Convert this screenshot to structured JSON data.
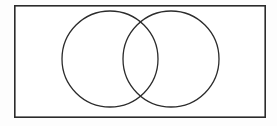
{
  "figure": {
    "kind": "venn-diagram",
    "background_color": "#fdfdfd",
    "canvas": {
      "width": 277,
      "height": 126
    }
  },
  "universe": {
    "name": "universal-set-rectangle",
    "label": "",
    "x": 14,
    "y": 5,
    "width": 252,
    "height": 113,
    "stroke_color": "#2b2b2b",
    "stroke_width": 1.6,
    "fill_color": "#ffffff"
  },
  "sets": [
    {
      "name": "set-a",
      "label": "",
      "cx": 110,
      "cy": 59,
      "r": 48,
      "stroke_color": "#2b2b2b",
      "stroke_width": 1.3,
      "fill_color": "none"
    },
    {
      "name": "set-b",
      "label": "",
      "cx": 171,
      "cy": 59,
      "r": 48,
      "stroke_color": "#2b2b2b",
      "stroke_width": 1.3,
      "fill_color": "none"
    }
  ],
  "regions": [
    {
      "name": "region-a-only",
      "label": "",
      "cx": 92,
      "cy": 59
    },
    {
      "name": "region-intersection",
      "label": "",
      "cx": 140,
      "cy": 59
    },
    {
      "name": "region-b-only",
      "label": "",
      "cx": 189,
      "cy": 59
    },
    {
      "name": "region-outside",
      "label": "",
      "cx": 35,
      "cy": 20
    }
  ],
  "intersection_points": [
    {
      "name": "upper-crossing",
      "x": 141,
      "y": 22
    },
    {
      "name": "lower-crossing",
      "x": 141,
      "y": 96
    }
  ],
  "chart_data": {
    "type": "diagram",
    "title": "",
    "xlabel": "",
    "ylabel": "",
    "categories": [
      "A only",
      "A ∩ B",
      "B only",
      "Outside (universe)"
    ],
    "values": [
      null,
      null,
      null,
      null
    ],
    "annotations": []
  }
}
